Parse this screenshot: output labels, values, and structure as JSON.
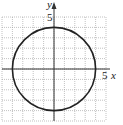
{
  "chart_data": {
    "type": "line",
    "title": "",
    "xlabel": "x",
    "ylabel": "y",
    "xlim": [
      -5,
      5
    ],
    "ylim": [
      -5,
      5
    ],
    "grid": true,
    "tick_labels": {
      "x": [
        "5"
      ],
      "y": [
        "5"
      ]
    },
    "series": [
      {
        "name": "circle",
        "center": [
          0,
          0
        ],
        "radius": 4,
        "points": [
          [
            4,
            0
          ],
          [
            0,
            4
          ],
          [
            -4,
            0
          ],
          [
            0,
            -4
          ]
        ]
      }
    ]
  },
  "labels": {
    "x_axis": "x",
    "y_axis": "y",
    "x_tick": "5",
    "y_tick": "5"
  }
}
